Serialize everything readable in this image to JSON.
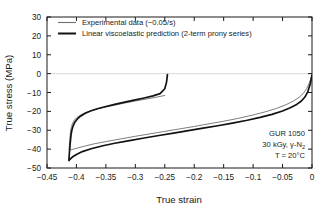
{
  "chart_data": {
    "type": "line",
    "title": "",
    "xlabel": "True strain",
    "ylabel": "True stress (MPa)",
    "xlim": [
      -0.45,
      0.0
    ],
    "ylim": [
      -50,
      30
    ],
    "xticks": [
      "-0.45",
      "-0.4",
      "-0.35",
      "-0.3",
      "-0.25",
      "-0.2",
      "-0.15",
      "-0.1",
      "-0.05",
      "0"
    ],
    "xtick_values": [
      -0.45,
      -0.4,
      -0.35,
      -0.3,
      -0.25,
      -0.2,
      -0.15,
      -0.1,
      -0.05,
      0
    ],
    "yticks": [
      "30",
      "20",
      "10",
      "0",
      "-10",
      "-20",
      "-30",
      "-40",
      "-50"
    ],
    "ytick_values": [
      30,
      20,
      10,
      0,
      -10,
      -20,
      -30,
      -40,
      -50
    ],
    "grid": "zero-line-only",
    "legend_position": "top-left",
    "series": [
      {
        "name": "Experimental data (−0.05/s)",
        "color": "#6e6e6e",
        "width": 0.9,
        "points": [
          [
            0.0,
            -0.8
          ],
          [
            -0.004,
            -4.5
          ],
          [
            -0.009,
            -8.0
          ],
          [
            -0.015,
            -10.6
          ],
          [
            -0.022,
            -12.6
          ],
          [
            -0.032,
            -14.6
          ],
          [
            -0.045,
            -16.6
          ],
          [
            -0.06,
            -18.4
          ],
          [
            -0.08,
            -20.3
          ],
          [
            -0.1,
            -21.9
          ],
          [
            -0.125,
            -23.7
          ],
          [
            -0.15,
            -25.2
          ],
          [
            -0.175,
            -26.6
          ],
          [
            -0.2,
            -28.0
          ],
          [
            -0.225,
            -29.3
          ],
          [
            -0.25,
            -30.6
          ],
          [
            -0.275,
            -31.9
          ],
          [
            -0.3,
            -33.2
          ],
          [
            -0.325,
            -34.6
          ],
          [
            -0.35,
            -36.0
          ],
          [
            -0.37,
            -37.2
          ],
          [
            -0.385,
            -38.3
          ],
          [
            -0.397,
            -39.3
          ],
          [
            -0.405,
            -40.0
          ],
          [
            -0.41,
            -40.4
          ],
          [
            -0.412,
            -40.6
          ],
          [
            -0.4125,
            -40.3
          ],
          [
            -0.412,
            -38.0
          ],
          [
            -0.4112,
            -35.0
          ],
          [
            -0.4105,
            -32.0
          ],
          [
            -0.4098,
            -30.0
          ],
          [
            -0.4085,
            -28.0
          ],
          [
            -0.4065,
            -26.2
          ],
          [
            -0.4035,
            -24.6
          ],
          [
            -0.399,
            -23.2
          ],
          [
            -0.393,
            -21.9
          ],
          [
            -0.385,
            -20.7
          ],
          [
            -0.375,
            -19.6
          ],
          [
            -0.363,
            -18.6
          ],
          [
            -0.35,
            -17.7
          ],
          [
            -0.335,
            -16.7
          ],
          [
            -0.318,
            -15.6
          ],
          [
            -0.3,
            -14.5
          ],
          [
            -0.282,
            -13.5
          ],
          [
            -0.265,
            -12.5
          ],
          [
            -0.25,
            -11.6
          ]
        ]
      },
      {
        "name": "Linear viscoelastic prediction (2-term prony series)",
        "color": "#121212",
        "width": 1.7,
        "points": [
          [
            0.0,
            -0.8
          ],
          [
            -0.003,
            -5.5
          ],
          [
            -0.007,
            -9.5
          ],
          [
            -0.012,
            -12.4
          ],
          [
            -0.018,
            -14.5
          ],
          [
            -0.026,
            -16.3
          ],
          [
            -0.037,
            -18.1
          ],
          [
            -0.05,
            -19.8
          ],
          [
            -0.068,
            -21.6
          ],
          [
            -0.088,
            -23.2
          ],
          [
            -0.11,
            -24.7
          ],
          [
            -0.135,
            -26.2
          ],
          [
            -0.16,
            -27.6
          ],
          [
            -0.185,
            -28.9
          ],
          [
            -0.21,
            -30.2
          ],
          [
            -0.235,
            -31.5
          ],
          [
            -0.26,
            -32.8
          ],
          [
            -0.285,
            -34.1
          ],
          [
            -0.31,
            -35.5
          ],
          [
            -0.335,
            -36.9
          ],
          [
            -0.355,
            -38.2
          ],
          [
            -0.375,
            -39.8
          ],
          [
            -0.39,
            -41.3
          ],
          [
            -0.4,
            -42.8
          ],
          [
            -0.407,
            -44.2
          ],
          [
            -0.411,
            -45.4
          ],
          [
            -0.4125,
            -46.1
          ],
          [
            -0.4128,
            -45.8
          ],
          [
            -0.4122,
            -43.0
          ],
          [
            -0.4112,
            -39.0
          ],
          [
            -0.4102,
            -35.5
          ],
          [
            -0.4092,
            -32.5
          ],
          [
            -0.4078,
            -30.0
          ],
          [
            -0.4058,
            -27.8
          ],
          [
            -0.4028,
            -25.8
          ],
          [
            -0.3985,
            -24.0
          ],
          [
            -0.3925,
            -22.4
          ],
          [
            -0.385,
            -21.0
          ],
          [
            -0.375,
            -19.7
          ],
          [
            -0.363,
            -18.5
          ],
          [
            -0.35,
            -17.4
          ],
          [
            -0.335,
            -16.3
          ],
          [
            -0.318,
            -15.1
          ],
          [
            -0.3,
            -13.9
          ],
          [
            -0.285,
            -12.9
          ],
          [
            -0.27,
            -11.8
          ],
          [
            -0.258,
            -10.6
          ],
          [
            -0.25,
            -8.0
          ],
          [
            -0.247,
            -4.5
          ],
          [
            -0.2455,
            -0.5
          ]
        ]
      }
    ],
    "annotations": [
      {
        "text": "GUR 1050"
      },
      {
        "text": "30 kGy, γ-N",
        "sub": "2"
      },
      {
        "text": "T = 20°C"
      }
    ]
  },
  "legend": {
    "items": [
      {
        "label": "Experimental data (−0.05/s)"
      },
      {
        "label": "Linear viscoelastic prediction (2-term prony series)"
      }
    ]
  }
}
